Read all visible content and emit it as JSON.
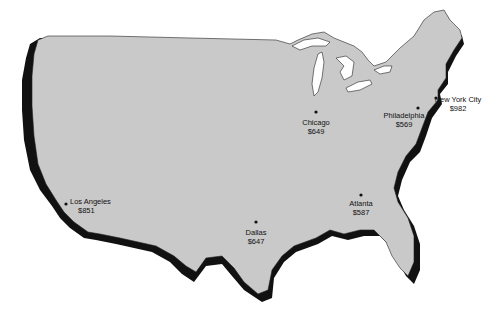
{
  "map": {
    "colors": {
      "land": "#c9c9c9",
      "shadow": "#111111",
      "outline": "#222222",
      "dot": "#111111",
      "background": "#ffffff"
    },
    "cities": [
      {
        "id": "los-angeles",
        "name": "Los Angeles",
        "price": "$851",
        "dot": [
          66,
          204
        ],
        "label": [
          70,
          197
        ],
        "align": "left"
      },
      {
        "id": "dallas",
        "name": "Dallas",
        "price": "$647",
        "dot": [
          256,
          222
        ],
        "label": [
          256,
          228
        ],
        "align": "center"
      },
      {
        "id": "chicago",
        "name": "Chicago",
        "price": "$649",
        "dot": [
          316,
          112
        ],
        "label": [
          316,
          118
        ],
        "align": "center"
      },
      {
        "id": "atlanta",
        "name": "Atlanta",
        "price": "$587",
        "dot": [
          361,
          195
        ],
        "label": [
          361,
          200
        ],
        "align": "center"
      },
      {
        "id": "philadelphia",
        "name": "Philadelphia",
        "price": "$569",
        "dot": [
          418,
          108
        ],
        "label": [
          404,
          111
        ],
        "align": "center"
      },
      {
        "id": "new-york-city",
        "name": "New York City",
        "price": "$982",
        "dot": [
          436,
          98
        ],
        "label": [
          457,
          99
        ],
        "align": "center"
      }
    ]
  }
}
